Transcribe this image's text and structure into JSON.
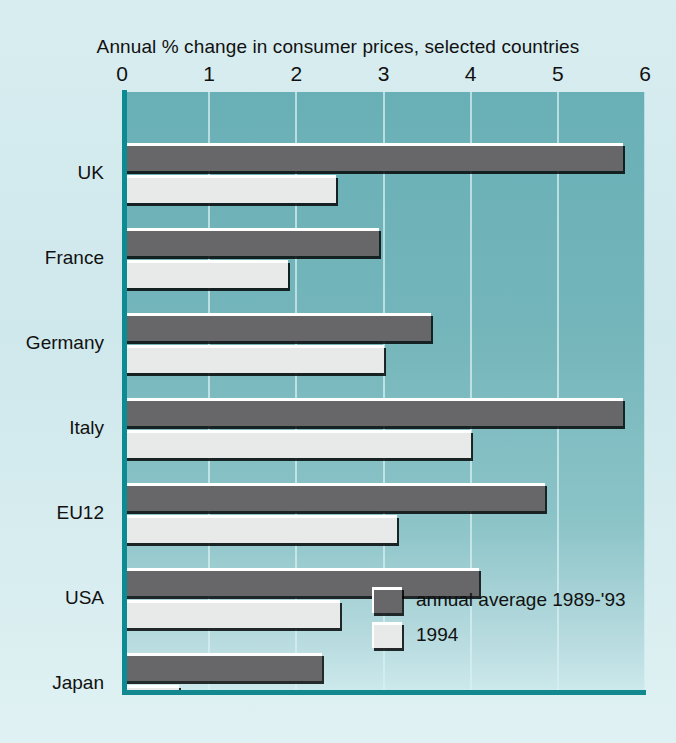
{
  "chart_data": {
    "type": "bar",
    "title": "Annual % change in consumer prices, selected countries",
    "xlabel": "",
    "ylabel": "",
    "orientation": "horizontal",
    "xlim": [
      0,
      6
    ],
    "xticks": [
      "0",
      "1",
      "2",
      "3",
      "4",
      "5",
      "6"
    ],
    "grid": true,
    "legend_position": "inside-bottom-right",
    "categories": [
      "UK",
      "France",
      "Germany",
      "Italy",
      "EU12",
      "USA",
      "Japan"
    ],
    "series": [
      {
        "name": "annual average 1989-'93",
        "color": "#67676a",
        "values": [
          5.75,
          2.95,
          3.55,
          5.75,
          4.85,
          4.1,
          2.3
        ]
      },
      {
        "name": "1994",
        "color": "#e8eaea",
        "values": [
          2.45,
          1.9,
          3.0,
          4.0,
          3.15,
          2.5,
          0.65
        ]
      }
    ]
  },
  "colors": {
    "page_background": "#cfe8ec",
    "plot_background": "#73b5ba",
    "axis_line": "#12898f",
    "gridline": "#d7f0f2",
    "series_dark": "#67676a",
    "series_light": "#e8eaea",
    "text": "#111111"
  }
}
